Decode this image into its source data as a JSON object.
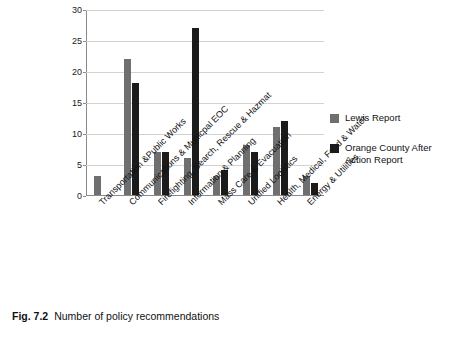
{
  "figure": {
    "caption_label": "Fig. 7.2",
    "caption_text": "Number of policy recommendations"
  },
  "legend": {
    "items": [
      {
        "label": "Lewis Report",
        "color": "#6f6f6f"
      },
      {
        "label": "Orange County After Action Report",
        "color": "#1b1b1b"
      }
    ]
  },
  "chart_data": {
    "type": "bar",
    "title": "",
    "xlabel": "",
    "ylabel": "",
    "ylim": [
      0,
      30
    ],
    "yticks": [
      0,
      5,
      10,
      15,
      20,
      25,
      30
    ],
    "grid": true,
    "legend_position": "right",
    "categories": [
      "Transportation &Public  Works",
      "Communications & Municpal EOC",
      "Firefighting, Search, Rescue & Hazmat",
      "Information & Planning",
      "Mass Care & Evacuation",
      "Unified Logistics",
      "Health, Medical,  Food & Water",
      "Energy & Utilities"
    ],
    "series": [
      {
        "name": "Lewis Report",
        "color": "#6f6f6f",
        "values": [
          3,
          22,
          7,
          6,
          3,
          8,
          11,
          3
        ]
      },
      {
        "name": "Orange County After Action Report",
        "color": "#1b1b1b",
        "values": [
          0,
          18,
          7,
          27,
          4,
          7,
          12,
          2
        ]
      }
    ]
  }
}
